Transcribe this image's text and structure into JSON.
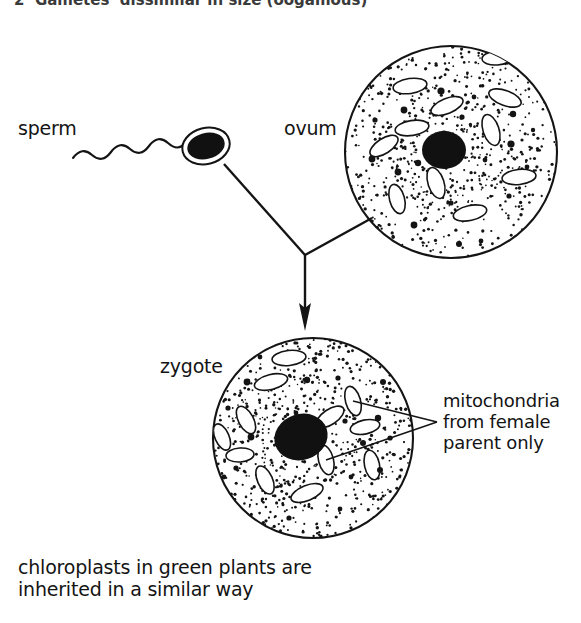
{
  "figure": {
    "title_partial": "2  Gametes  dissimilar in size (oogamous)",
    "background_color": "#ffffff",
    "ink_color": "#141414"
  },
  "labels": {
    "sperm": "sperm",
    "ovum": "ovum",
    "zygote": "zygote",
    "mitochondria_callout": "mitochondria\nfrom female\nparent only",
    "caption": "chloroplasts in green plants are\ninherited in a similar way"
  },
  "cells": {
    "ovum": {
      "name": "ovum",
      "center_x": 451,
      "center_y": 152,
      "radius": 107,
      "nucleus_x": 444,
      "nucleus_y": 150,
      "nucleus_rx": 22,
      "nucleus_ry": 19,
      "mitochondria_count": 11,
      "stipple_count": 520
    },
    "zygote": {
      "name": "zygote",
      "center_x": 313,
      "center_y": 438,
      "radius": 101,
      "nucleus_x": 301,
      "nucleus_y": 437,
      "nucleus_rx": 27,
      "nucleus_ry": 23,
      "mitochondria_count": 12,
      "stipple_count": 520
    },
    "sperm": {
      "name": "sperm",
      "head_x": 206,
      "head_y": 146,
      "head_rx": 21,
      "head_ry": 15,
      "tail_start_x": 73,
      "tail_end_x": 186
    }
  },
  "arrows": {
    "fusion_junction_x": 305,
    "fusion_junction_y": 255,
    "arrow_tip_x": 305,
    "arrow_tip_y": 331,
    "sperm_branch_from_x": 224,
    "sperm_branch_from_y": 164,
    "ovum_branch_from_x": 372,
    "ovum_branch_from_y": 218
  },
  "callout_leader": {
    "fork_x": 437,
    "fork_y": 422,
    "target_1_x": 353,
    "target_1_y": 401,
    "target_2_x": 326,
    "target_2_y": 460
  }
}
